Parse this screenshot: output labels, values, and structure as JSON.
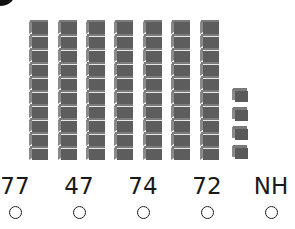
{
  "question": {
    "model": {
      "tens_rods": 7,
      "cubes_per_rod": 10,
      "ones_cubes": 4,
      "represented_value": 74
    },
    "choices": [
      {
        "label": "77",
        "selected": false
      },
      {
        "label": "47",
        "selected": false
      },
      {
        "label": "74",
        "selected": false
      },
      {
        "label": "72",
        "selected": false
      },
      {
        "label": "NH",
        "selected": false
      }
    ]
  },
  "colors": {
    "cube_front": "#5d5d5d",
    "cube_side": "#8a8a8a",
    "background": "#ffffff",
    "text": "#1a1a1a"
  }
}
